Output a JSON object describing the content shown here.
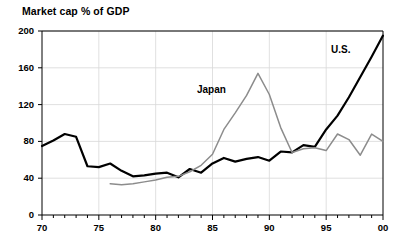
{
  "chart_data": {
    "type": "line",
    "title": "Market cap % of GDP",
    "xlabel": "",
    "ylabel": "",
    "xlim": [
      70,
      100
    ],
    "ylim": [
      0,
      200
    ],
    "ytick_labels": [
      "200",
      "160",
      "120",
      "80",
      "40",
      "0"
    ],
    "ytick_values": [
      200,
      160,
      120,
      80,
      40,
      0
    ],
    "xtick_labels": [
      "70",
      "75",
      "80",
      "85",
      "90",
      "95",
      "00"
    ],
    "xtick_values": [
      70,
      75,
      80,
      85,
      90,
      95,
      100
    ],
    "xtick_minor_step": 1,
    "grid": "horizontal-and-vertical-light",
    "legend": "inline-annotations",
    "series": [
      {
        "name": "U.S.",
        "color": "#000000",
        "width": 2.2,
        "label_position": [
          331,
          44
        ],
        "x": [
          70,
          71,
          72,
          73,
          74,
          75,
          76,
          77,
          78,
          79,
          80,
          81,
          82,
          83,
          84,
          85,
          86,
          87,
          88,
          89,
          90,
          91,
          92,
          93,
          94,
          95,
          96,
          97,
          98,
          99,
          100
        ],
        "values": [
          75,
          81,
          88,
          85,
          53,
          52,
          56,
          48,
          42,
          43,
          45,
          46,
          41,
          50,
          46,
          56,
          62,
          58,
          61,
          63,
          59,
          69,
          68,
          76,
          74,
          93,
          108,
          128,
          150,
          172,
          195
        ]
      },
      {
        "name": "Japan",
        "color": "#8c8c8c",
        "width": 1.5,
        "label_position": [
          197,
          84
        ],
        "x": [
          76,
          77,
          78,
          79,
          80,
          81,
          82,
          83,
          84,
          85,
          86,
          87,
          88,
          89,
          90,
          91,
          92,
          93,
          94,
          95,
          96,
          97,
          98,
          99,
          100
        ],
        "values": [
          34,
          33,
          34,
          36,
          38,
          41,
          42,
          47,
          54,
          66,
          93,
          111,
          130,
          154,
          131,
          95,
          68,
          72,
          73,
          70,
          88,
          82,
          65,
          88,
          80
        ]
      }
    ],
    "annotations": [
      {
        "text": "Japan",
        "series": "Japan"
      },
      {
        "text": "U.S.",
        "series": "U.S."
      }
    ]
  },
  "axes": {
    "frame_color": "#000000",
    "grid_color": "#d8d8d8",
    "background": "#ffffff"
  }
}
